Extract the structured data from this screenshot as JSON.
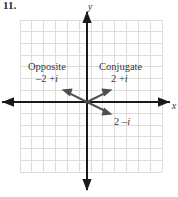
{
  "figure": {
    "problem_number": "11.",
    "axes": {
      "y_label": "y",
      "x_label": "x"
    },
    "grid": {
      "columns": 12,
      "rows": 13,
      "spacing_px": 11.8,
      "color": "#d9d9d9",
      "left": 20,
      "top": 20,
      "right": 162,
      "bottom": 172
    },
    "origin": {
      "x": 87,
      "y": 102
    },
    "annotations": [
      {
        "name": "opposite",
        "title": "Opposite",
        "value": "–2 + i",
        "value_real": "–2 +",
        "value_imag": "i"
      },
      {
        "name": "conjugate",
        "title": "Conjugate",
        "value": "2 + i",
        "value_real": "2 +",
        "value_imag": "i"
      },
      {
        "name": "original",
        "title": "",
        "value": "2 – i",
        "value_real": "2 –",
        "value_imag": "i"
      }
    ],
    "vectors": [
      {
        "name": "opposite-vector",
        "label": "–2 + i",
        "dx": -2,
        "dy": 1,
        "color": "#4a4a4a"
      },
      {
        "name": "conjugate-vector",
        "label": "2 + i",
        "dx": 2,
        "dy": 1,
        "color": "#4a4a4a"
      },
      {
        "name": "original-vector",
        "label": "2 – i",
        "dx": 2,
        "dy": -1,
        "color": "#4a4a4a"
      }
    ],
    "colors": {
      "grid": "#dcdcdc",
      "axis": "#1a1a1a",
      "vector": "#4f4f4f",
      "text": "#333333"
    }
  }
}
